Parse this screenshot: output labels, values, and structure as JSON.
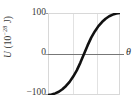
{
  "figure": {
    "name": "potential-energy-vs-angle-plot",
    "background_color": "#ffffff",
    "curve_color": "#111111",
    "axis_color": "#777777",
    "grid_color": "#e2e2e2",
    "frame_color": "#d8d8d8"
  },
  "axes": {
    "y_label_symbol": "U",
    "y_label_open": " (10",
    "y_label_exponent": "−28",
    "y_label_close": " J)",
    "y_label_full": "U (10−28 J)",
    "x_label": "θ"
  },
  "ticks": {
    "y": [
      {
        "label": "100"
      },
      {
        "label": "0"
      },
      {
        "label": "−100"
      }
    ]
  },
  "chart_data": {
    "type": "line",
    "title": "",
    "xlabel": "θ",
    "ylabel": "U (10−28 J)",
    "ylim": [
      -100,
      100
    ],
    "xlim": [
      0,
      1
    ],
    "grid": true,
    "grid_vertical_count": 2,
    "legend": null,
    "ytick_labels": [
      "100",
      "0",
      "−100"
    ],
    "ytick_values": [
      100,
      0,
      -100
    ],
    "xtick_labels": [],
    "series": [
      {
        "name": "U(θ)",
        "description": "smooth S-shaped (tanh-like) curve rising from −100 to +100",
        "x": [
          0.0,
          0.05,
          0.1,
          0.15,
          0.2,
          0.25,
          0.3,
          0.35,
          0.4,
          0.45,
          0.5,
          0.55,
          0.6,
          0.65,
          0.7,
          0.75,
          0.8,
          0.85,
          0.9,
          0.95,
          1.0
        ],
        "values": [
          -100,
          -99,
          -96,
          -92,
          -86,
          -78,
          -68,
          -55,
          -40,
          -21,
          0,
          21,
          40,
          55,
          68,
          78,
          86,
          92,
          96,
          99,
          100
        ]
      }
    ]
  }
}
